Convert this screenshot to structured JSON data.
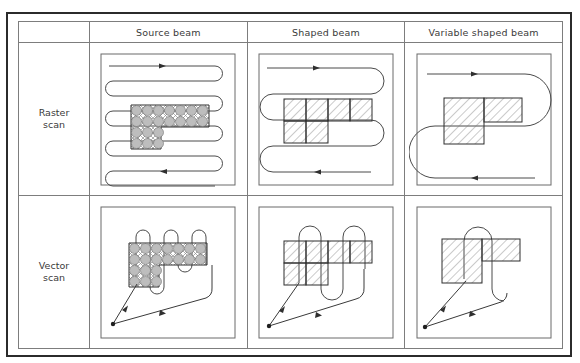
{
  "figure": {
    "kind": "comparison-matrix",
    "columns": [
      {
        "id": "source-beam",
        "label": "Source beam"
      },
      {
        "id": "shaped-beam",
        "label": "Shaped beam"
      },
      {
        "id": "variable-shaped-beam",
        "label": "Variable shaped beam"
      }
    ],
    "rows": [
      {
        "id": "raster-scan",
        "label_line1": "Raster",
        "label_line2": "scan"
      },
      {
        "id": "vector-scan",
        "label_line1": "Vector",
        "label_line2": "scan"
      }
    ],
    "corner_label": ""
  },
  "colors": {
    "frame": "#2b2b2b",
    "grid": "#7d7d7d",
    "panel_border": "#6a6a6a",
    "path": "#4a4a4a",
    "shape_outline": "#2f2f2f",
    "hatch": "#5a5a5a",
    "spot_fill": "#b9b9b9",
    "text": "#3a3a3a",
    "background": "#ffffff"
  },
  "cells": {
    "raster_source": {
      "id": "raster-source-beam",
      "scan_path": "serpentine-horizontal",
      "scan_line_count": 8,
      "coverage": "full-field",
      "flash_type": "round-spot",
      "spot_grid_cols_top": 7,
      "spot_grid_cols_bottom": 4,
      "spot_rows_top": 2,
      "spot_rows_bottom": 2,
      "arrow_marks": 2
    },
    "raster_shaped": {
      "id": "raster-shaped-beam",
      "scan_path": "serpentine-horizontal",
      "scan_line_count": 4,
      "coverage": "full-field",
      "flash_type": "square-flash",
      "flash_cols_top": 4,
      "flash_cols_bottom": 2,
      "arrow_marks": 2
    },
    "raster_variable": {
      "id": "raster-variable-shaped-beam",
      "scan_path": "serpentine-horizontal",
      "scan_line_count": 2,
      "coverage": "full-field",
      "flash_type": "variable-rectangle",
      "flash_count": 2,
      "arrow_marks": 2
    },
    "vector_source": {
      "id": "vector-source-beam",
      "scan_path": "serpentine-vertical-local",
      "coverage": "pattern-only",
      "flash_type": "round-spot",
      "spot_grid_cols_top": 7,
      "spot_grid_cols_bottom": 4,
      "deflection_vectors": 2,
      "origin": "bottom-left"
    },
    "vector_shaped": {
      "id": "vector-shaped-beam",
      "scan_path": "serpentine-vertical-local",
      "coverage": "pattern-only",
      "flash_type": "square-flash",
      "flash_cols_top": 4,
      "flash_cols_bottom": 2,
      "deflection_vectors": 2,
      "origin": "bottom-left"
    },
    "vector_variable": {
      "id": "vector-variable-shaped-beam",
      "scan_path": "single-loop-local",
      "coverage": "pattern-only",
      "flash_type": "variable-rectangle",
      "flash_count": 2,
      "deflection_vectors": 2,
      "origin": "bottom-left"
    }
  }
}
